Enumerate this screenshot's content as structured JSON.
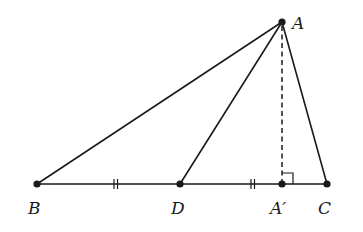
{
  "diagram": {
    "points": {
      "A": {
        "label": "A",
        "x": 282,
        "y": 22
      },
      "B": {
        "label": "B",
        "x": 37,
        "y": 184
      },
      "C": {
        "label": "C",
        "x": 327,
        "y": 184
      },
      "D": {
        "label": "D",
        "x": 180,
        "y": 184
      },
      "Aprime": {
        "label": "A′",
        "x": 282,
        "y": 184
      }
    },
    "segments": [
      {
        "from": "A",
        "to": "B",
        "style": "solid"
      },
      {
        "from": "A",
        "to": "D",
        "style": "solid"
      },
      {
        "from": "A",
        "to": "C",
        "style": "solid"
      },
      {
        "from": "B",
        "to": "C",
        "style": "solid"
      },
      {
        "from": "A",
        "to": "Aprime",
        "style": "dashed"
      }
    ],
    "marks": {
      "equal_ticks": [
        "BD",
        "DC"
      ],
      "right_angle_at": "Aprime"
    },
    "labels": {
      "A": "A",
      "B": "B",
      "C": "C",
      "D": "D",
      "Aprime": "A′"
    }
  }
}
